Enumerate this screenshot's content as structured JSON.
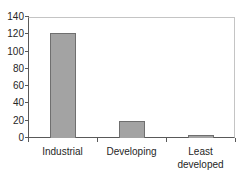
{
  "chart_data": {
    "type": "bar",
    "title": "",
    "xlabel": "",
    "ylabel": "",
    "categories": [
      "Industrial",
      "Developing",
      "Least developed"
    ],
    "values": [
      122,
      20,
      3
    ],
    "ylim": [
      0,
      140
    ],
    "yticks": [
      0,
      20,
      40,
      60,
      80,
      100,
      120,
      140
    ],
    "grid": false,
    "legend": "none",
    "colors": {
      "bar_fill": "#a3a3a3",
      "bar_border": "#6f6f6f",
      "axis_line": "#595959",
      "plot_border": "#c4c4c4",
      "tick_text": "#262626",
      "background": "#ffffff"
    }
  }
}
